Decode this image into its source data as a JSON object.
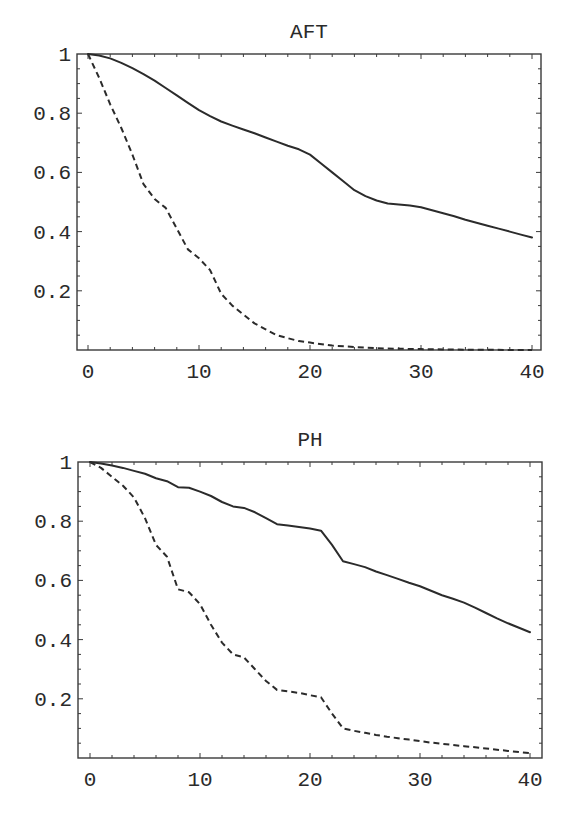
{
  "chart_data": [
    {
      "type": "line",
      "title": "AFT",
      "xlabel": "",
      "ylabel": "",
      "xlim": [
        -1,
        41
      ],
      "ylim": [
        0,
        1
      ],
      "xticks": [
        0,
        10,
        20,
        30,
        40
      ],
      "xtick_labels": [
        "0",
        "10",
        "20",
        "30",
        "40"
      ],
      "yticks": [
        0.2,
        0.4,
        0.6,
        0.8,
        1
      ],
      "ytick_labels": [
        "0.2",
        "0.4",
        "0.6",
        "0.8",
        "1"
      ],
      "grid": false,
      "legend": null,
      "series": [
        {
          "name": "solid",
          "style": "solid",
          "x": [
            0,
            1,
            2,
            3,
            4,
            5,
            6,
            7,
            8,
            9,
            10,
            11,
            12,
            13,
            14,
            15,
            16,
            17,
            18,
            19,
            20,
            21,
            22,
            23,
            24,
            25,
            26,
            27,
            28,
            29,
            30,
            31,
            32,
            33,
            34,
            35,
            36,
            37,
            38,
            39,
            40
          ],
          "y": [
            1.0,
            0.995,
            0.985,
            0.97,
            0.952,
            0.932,
            0.91,
            0.885,
            0.86,
            0.835,
            0.81,
            0.79,
            0.772,
            0.758,
            0.745,
            0.732,
            0.718,
            0.704,
            0.69,
            0.678,
            0.66,
            0.63,
            0.6,
            0.57,
            0.54,
            0.52,
            0.505,
            0.495,
            0.492,
            0.488,
            0.482,
            0.472,
            0.462,
            0.452,
            0.44,
            0.43,
            0.42,
            0.41,
            0.4,
            0.39,
            0.38
          ]
        },
        {
          "name": "dashed",
          "style": "dashed",
          "x": [
            0,
            1,
            2,
            3,
            4,
            5,
            6,
            7,
            8,
            9,
            10,
            11,
            12,
            13,
            14,
            15,
            16,
            17,
            18,
            19,
            20,
            22,
            24,
            26,
            28,
            30,
            32,
            34,
            36,
            38,
            40
          ],
          "y": [
            1.0,
            0.92,
            0.83,
            0.75,
            0.66,
            0.56,
            0.51,
            0.48,
            0.41,
            0.34,
            0.31,
            0.27,
            0.19,
            0.15,
            0.12,
            0.09,
            0.07,
            0.05,
            0.04,
            0.03,
            0.025,
            0.015,
            0.01,
            0.006,
            0.004,
            0.003,
            0.002,
            0.001,
            0.001,
            0.0,
            0.0
          ]
        }
      ]
    },
    {
      "type": "line",
      "title": "PH",
      "xlabel": "",
      "ylabel": "",
      "xlim": [
        -1,
        41
      ],
      "ylim": [
        0,
        1
      ],
      "xticks": [
        0,
        10,
        20,
        30,
        40
      ],
      "xtick_labels": [
        "0",
        "10",
        "20",
        "30",
        "40"
      ],
      "yticks": [
        0.2,
        0.4,
        0.6,
        0.8,
        1
      ],
      "ytick_labels": [
        "0.2",
        "0.4",
        "0.6",
        "0.8",
        "1"
      ],
      "grid": false,
      "legend": null,
      "series": [
        {
          "name": "solid",
          "style": "solid",
          "x": [
            0,
            1,
            2,
            3,
            4,
            5,
            6,
            7,
            8,
            9,
            10,
            11,
            12,
            13,
            14,
            15,
            16,
            17,
            18,
            19,
            20,
            21,
            22,
            23,
            24,
            25,
            26,
            27,
            28,
            29,
            30,
            31,
            32,
            33,
            34,
            35,
            36,
            37,
            38,
            39,
            40
          ],
          "y": [
            1.0,
            0.995,
            0.988,
            0.98,
            0.97,
            0.96,
            0.945,
            0.935,
            0.915,
            0.913,
            0.9,
            0.885,
            0.865,
            0.85,
            0.845,
            0.83,
            0.81,
            0.79,
            0.785,
            0.78,
            0.775,
            0.768,
            0.72,
            0.665,
            0.655,
            0.645,
            0.63,
            0.618,
            0.605,
            0.592,
            0.58,
            0.565,
            0.55,
            0.538,
            0.525,
            0.508,
            0.49,
            0.472,
            0.455,
            0.44,
            0.425
          ]
        },
        {
          "name": "dashed",
          "style": "dashed",
          "x": [
            0,
            1,
            2,
            3,
            4,
            5,
            6,
            7,
            8,
            9,
            10,
            11,
            12,
            13,
            14,
            15,
            16,
            17,
            18,
            19,
            20,
            21,
            22,
            23,
            24,
            25,
            26,
            27,
            28,
            29,
            30,
            31,
            32,
            33,
            34,
            35,
            36,
            37,
            38,
            39,
            40
          ],
          "y": [
            1.0,
            0.98,
            0.95,
            0.92,
            0.88,
            0.81,
            0.72,
            0.68,
            0.57,
            0.56,
            0.52,
            0.45,
            0.39,
            0.35,
            0.34,
            0.3,
            0.26,
            0.23,
            0.225,
            0.22,
            0.212,
            0.205,
            0.15,
            0.1,
            0.092,
            0.085,
            0.078,
            0.072,
            0.067,
            0.062,
            0.057,
            0.052,
            0.048,
            0.044,
            0.04,
            0.036,
            0.032,
            0.028,
            0.024,
            0.02,
            0.017
          ]
        }
      ]
    }
  ],
  "panels": [
    {
      "frame": {
        "left": 77,
        "top": 54,
        "right": 541,
        "bottom": 350
      },
      "x_origin_px": 88,
      "x_unit_px": 11.1
    },
    {
      "frame": {
        "left": 78,
        "top": 462,
        "right": 542,
        "bottom": 758
      },
      "x_origin_px": 90,
      "x_unit_px": 11.0
    }
  ]
}
